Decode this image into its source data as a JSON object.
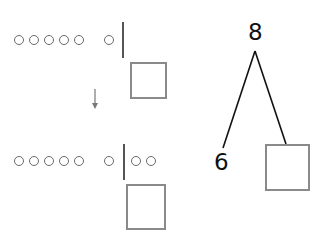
{
  "top_row": {
    "group_count": 5,
    "extra_count": 1,
    "right_count": 0
  },
  "bottom_row": {
    "group_count": 5,
    "extra_count": 1,
    "right_count": 2
  },
  "number_bond": {
    "whole": "8",
    "part_left": "6",
    "part_right": ""
  },
  "colors": {
    "stroke": "#111111",
    "circle": "#6a6a6a",
    "box": "#8a8a8a",
    "arrow": "#777777"
  }
}
